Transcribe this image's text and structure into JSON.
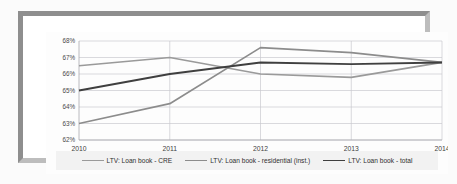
{
  "chart_data": {
    "type": "line",
    "title": "",
    "xlabel": "",
    "ylabel": "",
    "x": [
      "2010",
      "2011",
      "2012",
      "2013",
      "2014"
    ],
    "categories": [
      "2010",
      "2011",
      "2012",
      "2013",
      "2014"
    ],
    "ylim": [
      62,
      68
    ],
    "ytick_labels": [
      "68%",
      "67%",
      "66%",
      "65%",
      "64%",
      "63%",
      "62%"
    ],
    "ytick_values": [
      68,
      67,
      66,
      65,
      64,
      63,
      62
    ],
    "grid": true,
    "legend_position": "bottom",
    "series": [
      {
        "name": "LTV: Loan book - CRE",
        "color": "#9a9a9a",
        "values": [
          66.5,
          67.0,
          66.0,
          65.8,
          66.7
        ]
      },
      {
        "name": "LTV: Loan book - residential (inst.)",
        "color": "#8c8c8c",
        "values": [
          63.0,
          64.2,
          67.6,
          67.3,
          66.7
        ]
      },
      {
        "name": "LTV: Loan book - total",
        "color": "#3f3f3f",
        "values": [
          65.0,
          66.0,
          66.7,
          66.6,
          66.7
        ]
      }
    ]
  },
  "legend": {
    "items": [
      {
        "label": "LTV: Loan book - CRE",
        "color": "#9a9a9a"
      },
      {
        "label": "LTV: Loan book - residential (inst.)",
        "color": "#8c8c8c"
      },
      {
        "label": "LTV: Loan book - total",
        "color": "#3f3f3f"
      }
    ]
  },
  "axis": {
    "y": [
      "68%",
      "67%",
      "66%",
      "65%",
      "64%",
      "63%",
      "62%"
    ],
    "x": [
      "2010",
      "2011",
      "2012",
      "2013",
      "2014"
    ]
  }
}
